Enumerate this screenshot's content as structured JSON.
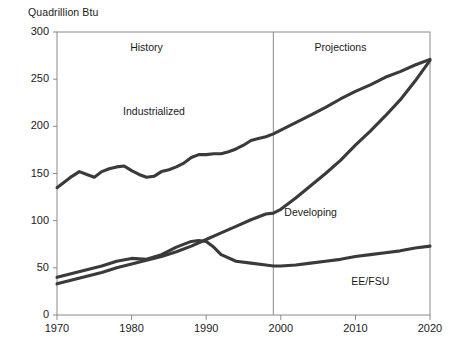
{
  "chart_data": {
    "type": "line",
    "title": "",
    "ylabel": "Quadrillion Btu",
    "xlabel": "",
    "ylim": [
      0,
      300
    ],
    "xlim": [
      1970,
      2020
    ],
    "yticks": [
      0,
      50,
      100,
      150,
      200,
      250,
      300
    ],
    "xticks": [
      1970,
      1980,
      1990,
      2000,
      2010,
      2020
    ],
    "grid": false,
    "legend_position": "inline-annotations",
    "annotations": [
      {
        "text": "History",
        "x": 1982,
        "y": 283
      },
      {
        "text": "Projections",
        "x": 2008,
        "y": 283
      },
      {
        "text": "Industrialized",
        "x": 1983,
        "y": 215
      },
      {
        "text": "Developing",
        "x": 2004,
        "y": 108
      },
      {
        "text": "EE/FSU",
        "x": 2012,
        "y": 35
      }
    ],
    "divider": {
      "x": 1999,
      "label": "history-projection-divider"
    },
    "series": [
      {
        "name": "Industrialized",
        "color": "#3a3a3a",
        "x": [
          1970,
          1971,
          1972,
          1973,
          1974,
          1975,
          1976,
          1977,
          1978,
          1979,
          1980,
          1981,
          1982,
          1983,
          1984,
          1985,
          1986,
          1987,
          1988,
          1989,
          1990,
          1991,
          1992,
          1993,
          1994,
          1995,
          1996,
          1997,
          1998,
          1999,
          2000,
          2002,
          2004,
          2006,
          2008,
          2010,
          2012,
          2014,
          2016,
          2018,
          2020
        ],
        "values": [
          135,
          141,
          147,
          152,
          149,
          146,
          152,
          155,
          157,
          158,
          153,
          149,
          146,
          147,
          152,
          154,
          157,
          161,
          167,
          170,
          170,
          171,
          171,
          173,
          176,
          180,
          185,
          187,
          189,
          192,
          196,
          204,
          212,
          220,
          229,
          237,
          244,
          252,
          258,
          265,
          271
        ]
      },
      {
        "name": "Developing",
        "color": "#3a3a3a",
        "x": [
          1970,
          1972,
          1974,
          1976,
          1978,
          1980,
          1982,
          1984,
          1986,
          1988,
          1990,
          1992,
          1994,
          1996,
          1998,
          1999,
          2000,
          2002,
          2004,
          2006,
          2008,
          2010,
          2012,
          2014,
          2016,
          2018,
          2020
        ],
        "values": [
          33,
          37,
          41,
          45,
          50,
          54,
          58,
          62,
          67,
          73,
          80,
          87,
          94,
          101,
          107,
          108,
          112,
          124,
          137,
          150,
          164,
          180,
          195,
          211,
          228,
          248,
          270
        ]
      },
      {
        "name": "EE/FSU",
        "color": "#3a3a3a",
        "x": [
          1970,
          1972,
          1974,
          1976,
          1978,
          1980,
          1982,
          1984,
          1985,
          1986,
          1988,
          1989,
          1990,
          1991,
          1992,
          1994,
          1996,
          1998,
          1999,
          2000,
          2002,
          2004,
          2006,
          2008,
          2010,
          2012,
          2014,
          2016,
          2018,
          2020
        ],
        "values": [
          40,
          44,
          48,
          52,
          57,
          60,
          59,
          64,
          68,
          72,
          78,
          79,
          78,
          72,
          64,
          57,
          55,
          53,
          52,
          52,
          53,
          55,
          57,
          59,
          62,
          64,
          66,
          68,
          71,
          73
        ]
      }
    ]
  }
}
